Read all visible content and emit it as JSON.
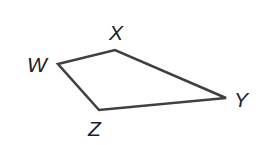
{
  "diagram": {
    "type": "quadrilateral",
    "stroke_color": "#404040",
    "label_color": "#222222",
    "vertices": [
      {
        "name": "W",
        "x": 58,
        "y": 64
      },
      {
        "name": "X",
        "x": 115,
        "y": 50
      },
      {
        "name": "Y",
        "x": 226,
        "y": 98
      },
      {
        "name": "Z",
        "x": 99,
        "y": 110
      }
    ],
    "labels": {
      "W": "W",
      "X": "X",
      "Y": "Y",
      "Z": "Z"
    }
  }
}
